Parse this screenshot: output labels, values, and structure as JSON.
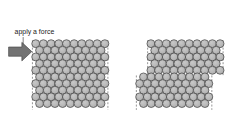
{
  "figure": {
    "background_color": "#ffffff",
    "width": 235,
    "height": 137
  },
  "annotation": {
    "label": "apply a force",
    "label_x": 22,
    "label_y": 16,
    "font_size": 10.5,
    "text_color": "#1a1a1a",
    "leader_line": {
      "name": "leader-line",
      "x1": 35,
      "y1": 21,
      "x2": 35,
      "y2": 40,
      "color": "#555555",
      "width": 1.1
    }
  },
  "force_arrow": {
    "name": "force-arrow",
    "direction": "right",
    "fill_color": "#737373",
    "stroke_color": "#3d3d3d",
    "stroke_width": 0.9,
    "points": "13,36 33,36 33,29 48,43 33,57 33,50 13,50"
  },
  "atoms": {
    "radius": 6.0,
    "spacing_x": 11.6,
    "spacing_y": 10.05,
    "fill_color": "#b6b6b6",
    "stroke_color": "#3a3a3a",
    "stroke_width": 1.0,
    "highlight_color": "#c9c9c9"
  },
  "boundary_lines": {
    "color": "#7a7a7a",
    "width": 1.2,
    "dash": "3,2.5"
  },
  "crystals": [
    {
      "name": "undeformed-crystal",
      "caption": "",
      "origin_x": 54,
      "origin_y": 31,
      "rows": 10,
      "cols": 9,
      "offset_rows": [
        0,
        0,
        0,
        0,
        0,
        0,
        0,
        0,
        0,
        0
      ],
      "boundary_left_x": 49,
      "boundary_right_x": 163,
      "boundary_top_y": 26,
      "boundary_bottom_y": 131
    },
    {
      "name": "slipped-crystal",
      "caption": "",
      "origin_x": 228,
      "origin_y": 31,
      "rows": 10,
      "cols": 9,
      "offset_rows": [
        0,
        0,
        0,
        0,
        0,
        -17,
        -17,
        -17,
        -17,
        -17
      ],
      "slip_plane_row": 5,
      "slip_offset_px": -17,
      "boundary_top_left_x": 223,
      "boundary_top_right_x": 337,
      "boundary_bottom_left_x": 206,
      "boundary_bottom_right_x": 320,
      "boundary_top_y": 26,
      "boundary_mid_y": 79,
      "boundary_bottom_y": 131
    }
  ]
}
